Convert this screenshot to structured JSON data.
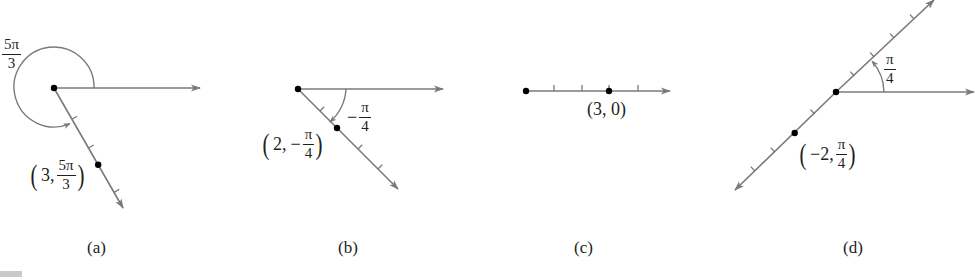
{
  "figure": {
    "title_fragment": "Figure",
    "colors": {
      "axis": "#7a7a7a",
      "ink": "#231f20",
      "point": "#000000"
    }
  },
  "panels": [
    {
      "id": "a",
      "caption": "(a)",
      "origin": [
        54,
        88
      ],
      "polar_axis_end": [
        200,
        88
      ],
      "ray": {
        "end": [
          123,
          208
        ],
        "ticks_t": [
          0.26,
          0.5,
          0.87
        ],
        "point_t": 0.64,
        "tick_side": 1
      },
      "arc": {
        "type": "circle-large",
        "r": 40,
        "label_num": "5π",
        "label_den": "3"
      },
      "point_label": {
        "r": "3",
        "theta_num": "5π",
        "theta_den": "3",
        "negative_r": false
      }
    },
    {
      "id": "b",
      "caption": "(b)",
      "origin": [
        298,
        89
      ],
      "polar_axis_end": [
        443,
        89
      ],
      "ray": {
        "end": [
          398,
          189
        ],
        "ticks_t": [
          0.22,
          0.6,
          0.8
        ],
        "point_t": 0.39,
        "tick_side": -1
      },
      "arc": {
        "type": "clockwise-small",
        "r": 48,
        "label_num": "π",
        "label_den": "4",
        "label_sign": "−"
      },
      "point_label": {
        "r": "2",
        "theta_sign": "−",
        "theta_num": "π",
        "theta_den": "4",
        "negative_r": false
      }
    },
    {
      "id": "c",
      "caption": "(c)",
      "origin": [
        526,
        91
      ],
      "polar_axis_end": [
        670,
        91
      ],
      "ticks_x": [
        554,
        582,
        638
      ],
      "point": [
        609,
        91
      ],
      "point_label": {
        "text": "(3, 0)"
      }
    },
    {
      "id": "d",
      "caption": "(d)",
      "origin": [
        836,
        92
      ],
      "polar_axis_end": [
        974,
        92
      ],
      "line": {
        "start": [
          735,
          190
        ],
        "end": [
          934,
          0
        ],
        "ticks_t": [
          0.1,
          0.2,
          0.4,
          0.6,
          0.7,
          0.8,
          0.9
        ],
        "point_t": 0.3
      },
      "arc": {
        "type": "counterclockwise-small",
        "r": 48,
        "label_num": "π",
        "label_den": "4"
      },
      "point_label": {
        "r": "−2",
        "theta_num": "π",
        "theta_den": "4",
        "negative_r": true
      }
    }
  ],
  "captions": {
    "a": "(a)",
    "b": "(b)",
    "c": "(c)",
    "d": "(d)"
  },
  "labels": {
    "a_angle_num": "5π",
    "a_angle_den": "3",
    "a_point_r": "3,",
    "a_point_num": "5π",
    "a_point_den": "3",
    "b_angle_sign": "−",
    "b_angle_num": "π",
    "b_angle_den": "4",
    "b_point_r": "2,",
    "b_point_sign": "−",
    "b_point_num": "π",
    "b_point_den": "4",
    "c_point": "(3, 0)",
    "d_angle_num": "π",
    "d_angle_den": "4",
    "d_point_r": "−2,",
    "d_point_num": "π",
    "d_point_den": "4"
  }
}
